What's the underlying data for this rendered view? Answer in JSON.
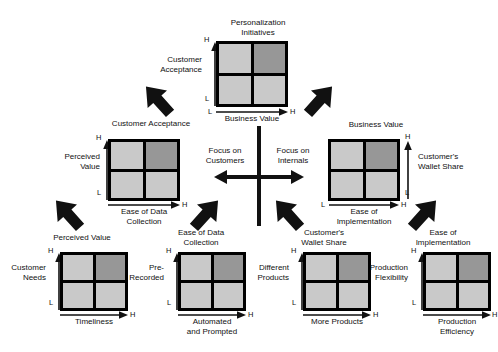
{
  "diagram": {
    "center": {
      "left_label": "Focus on\nCustomers",
      "right_label": "Focus on\nInternals"
    },
    "caption": "",
    "axis_ticks": {
      "low": "L",
      "high": "H"
    },
    "colors": {
      "cell_light": "#c9c9c9",
      "cell_dark": "#979797",
      "frame": "#000000",
      "text": "#111111"
    },
    "matrices": [
      {
        "id": "personalization-initiatives",
        "title": "Personalization\nInitiatives",
        "y_label": "Customer\nAcceptance",
        "x_label": "Business Value",
        "y_axis_side": "left",
        "cells": [
          "light",
          "dark",
          "light",
          "light"
        ]
      },
      {
        "id": "customer-acceptance",
        "title": "Customer Acceptance",
        "y_label": "Perceived\nValue",
        "x_label": "Ease of Data\nCollection",
        "y_axis_side": "left",
        "cells": [
          "light",
          "dark",
          "light",
          "light"
        ]
      },
      {
        "id": "business-value",
        "title": "Business Value",
        "y_label": "Customer's\nWallet Share",
        "x_label": "Ease of\nImplementation",
        "y_axis_side": "right",
        "cells": [
          "light",
          "dark",
          "light",
          "light"
        ]
      },
      {
        "id": "perceived-value",
        "title": "Perceived Value",
        "y_label": "Customer\nNeeds",
        "x_label": "Timeliness",
        "y_axis_side": "left",
        "cells": [
          "light",
          "dark",
          "light",
          "light"
        ]
      },
      {
        "id": "ease-of-data-collection",
        "title": "Ease of Data\nCollection",
        "y_label": "Pre-\nRecorded",
        "x_label": "Automated\nand Prompted",
        "y_axis_side": "left",
        "cells": [
          "light",
          "dark",
          "light",
          "light"
        ]
      },
      {
        "id": "customers-wallet-share",
        "title": "Customer's\nWallet Share",
        "y_label": "Different\nProducts",
        "x_label": "More  Products",
        "y_axis_side": "left",
        "cells": [
          "light",
          "dark",
          "light",
          "light"
        ]
      },
      {
        "id": "ease-of-implementation",
        "title": "Ease of\nImplementation",
        "y_label": "Production\nFlexibility",
        "x_label": "Production\nEfficiency",
        "y_axis_side": "left",
        "cells": [
          "light",
          "dark",
          "light",
          "light"
        ]
      }
    ]
  }
}
